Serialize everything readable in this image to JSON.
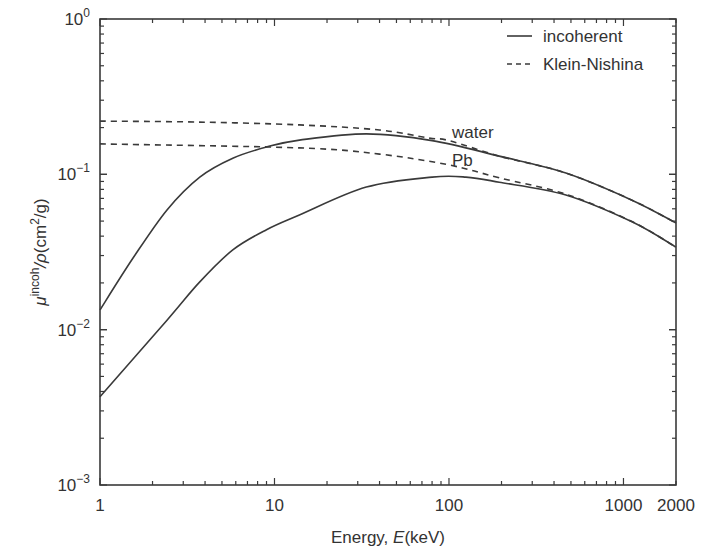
{
  "chart_data": {
    "type": "line",
    "title": "",
    "xlabel": "Energy, E(keV)",
    "xlabel_parts": [
      "Energy, ",
      "E",
      "(keV)"
    ],
    "ylabel": "μ^incoh/ρ(cm^2/g)",
    "ylabel_parts": {
      "mu": "μ",
      "sup": "incoh",
      "rest": "/ρ(cm",
      "sup2": "2",
      "end": "/g)"
    },
    "xscale": "log",
    "yscale": "log",
    "xlim": [
      1,
      2000
    ],
    "ylim": [
      0.001,
      1
    ],
    "x_ticks": [
      {
        "value": 1,
        "label": "1"
      },
      {
        "value": 10,
        "label": "10"
      },
      {
        "value": 100,
        "label": "100"
      },
      {
        "value": 1000,
        "label": "1000"
      },
      {
        "value": 2000,
        "label": "2000"
      }
    ],
    "y_ticks": [
      {
        "value": 1,
        "base": "10",
        "exp": "0"
      },
      {
        "value": 0.1,
        "base": "10",
        "exp": "−1"
      },
      {
        "value": 0.01,
        "base": "10",
        "exp": "−2"
      },
      {
        "value": 0.001,
        "base": "10",
        "exp": "−3"
      }
    ],
    "grid": false,
    "legend": {
      "position": "upper right",
      "entries": [
        {
          "label": "incoherent",
          "style": "solid"
        },
        {
          "label": "Klein-Nishina",
          "style": "dashed"
        }
      ]
    },
    "annotations": [
      {
        "text": "water",
        "x": 100,
        "y": 0.19
      },
      {
        "text": "Pb",
        "x": 100,
        "y": 0.125
      }
    ],
    "series": [
      {
        "name": "water incoherent",
        "style": "solid",
        "x": [
          1,
          1.55,
          2.42,
          3.73,
          5.77,
          9.0,
          13.9,
          33.6,
          80,
          194,
          468,
          1126,
          2000
        ],
        "values": [
          0.0134,
          0.029,
          0.059,
          0.096,
          0.127,
          0.15,
          0.166,
          0.182,
          0.165,
          0.131,
          0.102,
          0.068,
          0.0486
        ]
      },
      {
        "name": "Pb incoherent",
        "style": "solid",
        "x": [
          1,
          2.42,
          3.73,
          5.77,
          9.0,
          13.9,
          33.6,
          80,
          125,
          194,
          468,
          1126,
          2000
        ],
        "values": [
          0.0037,
          0.0115,
          0.0203,
          0.0326,
          0.044,
          0.0547,
          0.0828,
          0.096,
          0.096,
          0.089,
          0.0736,
          0.0493,
          0.034
        ]
      },
      {
        "name": "water Klein-Nishina",
        "style": "dashed",
        "x": [
          1,
          3.7,
          13.9,
          40,
          77,
          100,
          194,
          468,
          1126,
          2000
        ],
        "values": [
          0.22,
          0.217,
          0.208,
          0.193,
          0.171,
          0.165,
          0.131,
          0.102,
          0.068,
          0.0486
        ]
      },
      {
        "name": "Pb Klein-Nishina",
        "style": "dashed",
        "x": [
          1,
          13.9,
          40,
          100,
          194,
          468,
          1126,
          2000
        ],
        "values": [
          0.157,
          0.148,
          0.135,
          0.115,
          0.095,
          0.0745,
          0.0495,
          0.034
        ]
      }
    ],
    "colors": {
      "line": "#3a3a3a",
      "axis": "#3a3a3a",
      "text": "#333333"
    }
  }
}
